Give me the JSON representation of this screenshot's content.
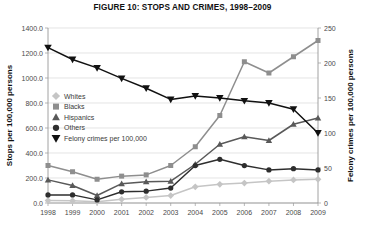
{
  "chart_data": {
    "type": "line",
    "title": "FIGURE 10: STOPS AND CRIMES, 1998–2009",
    "xlabel": "",
    "ylabel": "Stops per 100,000 persons",
    "y2label": "Felony crimes per 100,000 persons",
    "categories": [
      "1998",
      "1999",
      "2000",
      "2001",
      "2002",
      "2003",
      "2004",
      "2005",
      "2006",
      "2007",
      "2008",
      "2009"
    ],
    "ylim": [
      0,
      1400
    ],
    "y2lim": [
      0,
      250
    ],
    "yticks": [
      "0.0",
      "200.0",
      "400.0",
      "600.0",
      "800.0",
      "1000.0",
      "1200.0",
      "1400.0"
    ],
    "y2ticks": [
      "0",
      "50",
      "100",
      "150",
      "200",
      "250"
    ],
    "grid": true,
    "legend_position": "upper-left-inside",
    "series": [
      {
        "name": "Whites",
        "marker": "diamond",
        "color": "#c5c5c5",
        "axis": "left",
        "values": [
          20,
          18,
          10,
          30,
          45,
          60,
          130,
          150,
          160,
          175,
          185,
          190
        ]
      },
      {
        "name": "Blacks",
        "marker": "square",
        "color": "#8e8e8e",
        "axis": "left",
        "values": [
          300,
          250,
          190,
          215,
          225,
          300,
          450,
          700,
          1130,
          1040,
          1170,
          1300
        ]
      },
      {
        "name": "Hispanics",
        "marker": "triangle",
        "color": "#595959",
        "axis": "left",
        "values": [
          185,
          140,
          60,
          155,
          170,
          175,
          310,
          470,
          530,
          500,
          630,
          680
        ]
      },
      {
        "name": "Others",
        "marker": "circle",
        "color": "#2e2e2e",
        "axis": "left",
        "values": [
          65,
          65,
          25,
          90,
          95,
          120,
          300,
          350,
          300,
          265,
          275,
          265
        ]
      },
      {
        "name": "Felony crimes per 100,000",
        "marker": "triangle-down",
        "color": "#111111",
        "axis": "right",
        "values": [
          222,
          205,
          193,
          178,
          164,
          148,
          153,
          150,
          146,
          143,
          134,
          100
        ]
      }
    ]
  }
}
